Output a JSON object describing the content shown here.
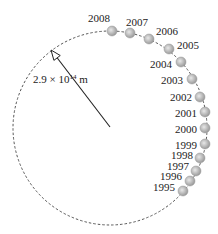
{
  "diagram": {
    "radius_label": {
      "mantissa": "2.9",
      "times": "×",
      "base": "10",
      "exponent": "14",
      "unit": "m"
    },
    "circle": {
      "cx": 110,
      "cy": 128,
      "r": 97,
      "style": "dashed"
    },
    "arrow": {
      "from": [
        110,
        127
      ],
      "to": [
        51,
        50
      ]
    },
    "dot_color": "#b8b8b8",
    "points": [
      {
        "year": "2008",
        "x": 112,
        "y": 31,
        "lx": 88,
        "ly": 13
      },
      {
        "year": "2007",
        "x": 130,
        "y": 33,
        "lx": 126,
        "ly": 17
      },
      {
        "year": "2006",
        "x": 149,
        "y": 39,
        "lx": 156,
        "ly": 26
      },
      {
        "year": "2005",
        "x": 169,
        "y": 49,
        "lx": 177,
        "ly": 40
      },
      {
        "year": "2004",
        "x": 181,
        "y": 62,
        "lx": 150,
        "ly": 59
      },
      {
        "year": "2003",
        "x": 192,
        "y": 79,
        "lx": 161,
        "ly": 75
      },
      {
        "year": "2002",
        "x": 200,
        "y": 97,
        "lx": 170,
        "ly": 92
      },
      {
        "year": "2001",
        "x": 205,
        "y": 112,
        "lx": 175,
        "ly": 108
      },
      {
        "year": "2000",
        "x": 205,
        "y": 128,
        "lx": 175,
        "ly": 124
      },
      {
        "year": "1999",
        "x": 205,
        "y": 144,
        "lx": 175,
        "ly": 140
      },
      {
        "year": "1998",
        "x": 200,
        "y": 158,
        "lx": 171,
        "ly": 150
      },
      {
        "year": "1997",
        "x": 196,
        "y": 171,
        "lx": 167,
        "ly": 161
      },
      {
        "year": "1996",
        "x": 190,
        "y": 181,
        "lx": 160,
        "ly": 171
      },
      {
        "year": "1995",
        "x": 183,
        "y": 191,
        "lx": 153,
        "ly": 182
      }
    ]
  }
}
